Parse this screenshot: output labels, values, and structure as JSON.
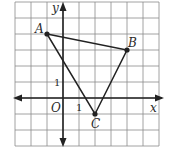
{
  "figure": {
    "type": "coordinate-plane-triangle",
    "grid": {
      "x_min": -3,
      "x_max": 6,
      "y_min": -3,
      "y_max": 6,
      "unit_px": 16,
      "origin_px": [
        63,
        98
      ]
    },
    "axes": {
      "x_label": "x",
      "y_label": "y",
      "origin_label": "O",
      "x_tick_label": "1",
      "y_tick_label": "1"
    },
    "points": [
      {
        "name": "A",
        "x": -1,
        "y": 4
      },
      {
        "name": "B",
        "x": 4,
        "y": 3
      },
      {
        "name": "C",
        "x": 2,
        "y": -1
      }
    ],
    "colors": {
      "grid": "#8a8a8a",
      "axis": "#222222",
      "triangle": "#222222",
      "background": "#ffffff"
    }
  }
}
